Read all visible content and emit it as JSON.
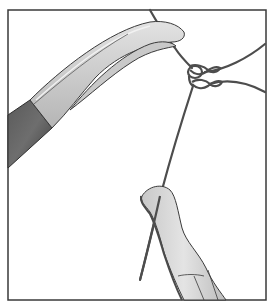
{
  "figure": {
    "colors": {
      "border": "#3a3a3a",
      "background": "#ffffff",
      "instrument_light": "#d4d4d4",
      "instrument_mid": "#b8b8b8",
      "instrument_dark": "#4a4a4a",
      "suture": "#4d4d4d"
    },
    "elements": [
      "needle-holder",
      "forceps",
      "suture-knot",
      "suture-strands"
    ]
  }
}
